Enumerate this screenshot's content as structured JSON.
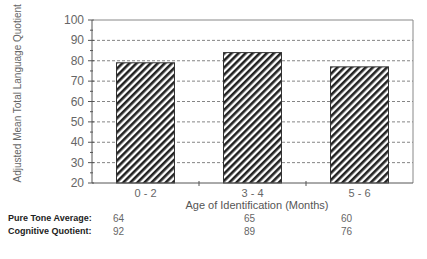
{
  "chart_data": {
    "type": "bar",
    "title": "",
    "xlabel": "Age of Identification (Months)",
    "ylabel": "Adjusted Mean Total Language Quotient",
    "categories": [
      "0 - 2",
      "3 - 4",
      "5 - 6"
    ],
    "values": [
      79,
      84,
      77
    ],
    "ylim": [
      20,
      100
    ],
    "yticks": [
      20,
      30,
      40,
      50,
      60,
      70,
      80,
      90,
      100
    ],
    "grid": "horizontal dashed",
    "bar_fill": "diagonal hatch",
    "table": [
      {
        "label": "Pure Tone Average:",
        "values": [
          "64",
          "65",
          "60"
        ]
      },
      {
        "label": "Cognitive Quotient:",
        "values": [
          "92",
          "89",
          "76"
        ]
      }
    ]
  }
}
